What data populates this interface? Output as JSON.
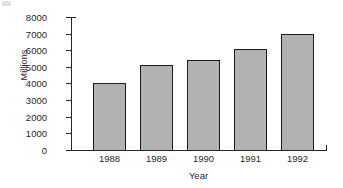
{
  "chart_data": {
    "type": "bar",
    "title": "",
    "xlabel": "Year",
    "ylabel": "Millions",
    "categories": [
      "1988",
      "1989",
      "1990",
      "1991",
      "1992"
    ],
    "values": [
      4050,
      5100,
      5400,
      6100,
      7000
    ],
    "ylim": [
      0,
      8000
    ],
    "yticks": [
      "0",
      "1000",
      "2000",
      "3000",
      "4000",
      "5000",
      "6000",
      "7000",
      "8000"
    ],
    "ytick_values": [
      0,
      1000,
      2000,
      3000,
      4000,
      5000,
      6000,
      7000,
      8000
    ],
    "grid": false,
    "legend": null,
    "bar_fill_color": "#b2b2b2",
    "bar_edge_color": "#1c1c1c",
    "axis_color": "#262626",
    "background_color": "#ffffff"
  }
}
